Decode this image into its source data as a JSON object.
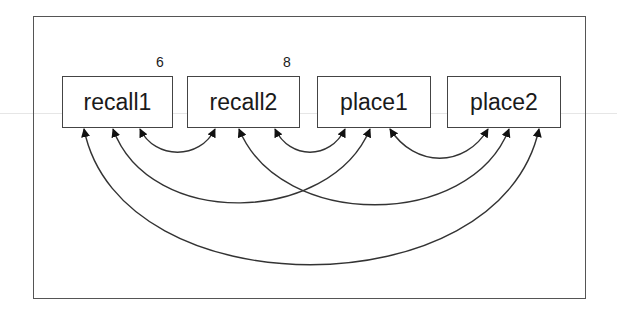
{
  "diagram": {
    "type": "path-diagram (residual covariances)",
    "nodes": [
      {
        "id": "recall1",
        "label": "recall1"
      },
      {
        "id": "recall2",
        "label": "recall2"
      },
      {
        "id": "place1",
        "label": "place1"
      },
      {
        "id": "place2",
        "label": "place2"
      }
    ],
    "node_annotations": [
      {
        "node": "recall1",
        "value": "6"
      },
      {
        "node": "recall2",
        "value": "8"
      }
    ],
    "edges": [
      {
        "from": "recall1",
        "to": "recall2",
        "type": "double-headed curved"
      },
      {
        "from": "recall2",
        "to": "place1",
        "type": "double-headed curved"
      },
      {
        "from": "place1",
        "to": "place2",
        "type": "double-headed curved"
      },
      {
        "from": "recall1",
        "to": "place1",
        "type": "double-headed curved"
      },
      {
        "from": "recall2",
        "to": "place2",
        "type": "double-headed curved"
      },
      {
        "from": "recall1",
        "to": "place2",
        "type": "double-headed curved"
      }
    ],
    "colors": {
      "line": "#333333",
      "background": "#ffffff"
    }
  }
}
